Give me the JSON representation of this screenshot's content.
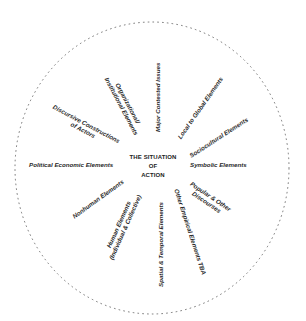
{
  "diagram": {
    "title_lines": [
      "THE SITUATION",
      "OF",
      "ACTION"
    ],
    "border": {
      "style": "dotted-circle",
      "color": "#555555"
    },
    "elements": [
      {
        "id": "major-contested-issues",
        "lines": [
          "Major Contested Issues"
        ]
      },
      {
        "id": "organizational-institutional",
        "lines": [
          "Organizational/",
          "Institutional Elements"
        ]
      },
      {
        "id": "discursive-constructions",
        "lines": [
          "Discursive Constructions",
          "of Actors"
        ]
      },
      {
        "id": "political-economic",
        "lines": [
          "Political Economic Elements"
        ]
      },
      {
        "id": "nonhuman",
        "lines": [
          "Nonhuman Elements"
        ]
      },
      {
        "id": "human",
        "lines": [
          "Human Elements",
          "(Individual & Collective)"
        ]
      },
      {
        "id": "spatial-temporal",
        "lines": [
          "Spatial & Temporal Elements"
        ]
      },
      {
        "id": "other-empirical",
        "lines": [
          "Other Empirical Elements TBA"
        ]
      },
      {
        "id": "popular-discourses",
        "lines": [
          "Popular & Other",
          "Discourses"
        ]
      },
      {
        "id": "symbolic",
        "lines": [
          "Symbolic Elements"
        ]
      },
      {
        "id": "sociocultural",
        "lines": [
          "Sociocultural Elements"
        ]
      },
      {
        "id": "local-to-global",
        "lines": [
          "Local to Global Elements"
        ]
      }
    ]
  }
}
